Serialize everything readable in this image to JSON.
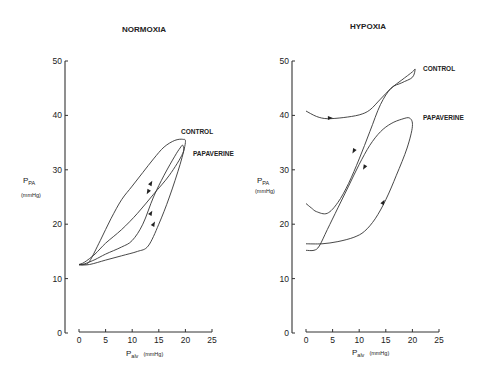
{
  "chart_data": [
    {
      "type": "line",
      "title": "NORMOXIA",
      "xlabel": "P_alv (mmHg)",
      "xlabel_main": "P",
      "xlabel_sub": "alv",
      "xlabel_unit": "(mmHg)",
      "ylabel_main": "P",
      "ylabel_sub": "PA",
      "ylabel_unit": "(mmHg)",
      "xlim": [
        0,
        25
      ],
      "ylim": [
        0,
        50
      ],
      "xticks": [
        0,
        5,
        10,
        15,
        20,
        25
      ],
      "yticks": [
        0,
        10,
        20,
        30,
        40,
        50
      ],
      "grid": false,
      "series": [
        {
          "name": "CONTROL",
          "points": [
            [
              0,
              12.6
            ],
            [
              1,
              12.6
            ],
            [
              2,
              13.2
            ],
            [
              4,
              17
            ],
            [
              6,
              21
            ],
            [
              8,
              24.5
            ],
            [
              10,
              27
            ],
            [
              12,
              29.5
            ],
            [
              14,
              32
            ],
            [
              16,
              34.2
            ],
            [
              18,
              35.4
            ],
            [
              19.5,
              35.6
            ],
            [
              20,
              35
            ],
            [
              19,
              31
            ],
            [
              17,
              25
            ],
            [
              15,
              20
            ],
            [
              13,
              16
            ],
            [
              11,
              15
            ],
            [
              8,
              14.2
            ],
            [
              5,
              13.4
            ],
            [
              2,
              12.6
            ],
            [
              0,
              12.5
            ]
          ],
          "arrows": [
            [
              13.5,
              27.5,
              "up"
            ],
            [
              13.5,
              22,
              "up"
            ]
          ]
        },
        {
          "name": "PAPAVERINE",
          "points": [
            [
              0,
              12.6
            ],
            [
              1,
              12.7
            ],
            [
              3,
              13.5
            ],
            [
              5,
              14.5
            ],
            [
              8,
              15.8
            ],
            [
              10,
              17
            ],
            [
              12,
              20
            ],
            [
              14,
              25
            ],
            [
              16,
              29
            ],
            [
              18,
              32.5
            ],
            [
              19,
              34
            ],
            [
              19.5,
              34.5
            ],
            [
              19.5,
              33
            ],
            [
              17,
              29
            ],
            [
              14,
              25.5
            ],
            [
              11,
              22
            ],
            [
              8,
              19
            ],
            [
              5,
              16.5
            ],
            [
              3,
              14.5
            ],
            [
              1,
              13
            ],
            [
              0,
              12.6
            ]
          ],
          "arrows": [
            [
              13,
              26,
              "down"
            ],
            [
              14,
              20,
              "up"
            ]
          ]
        }
      ],
      "annotations": [
        "CONTROL",
        "PAPAVERINE"
      ]
    },
    {
      "type": "line",
      "title": "HYPOXIA",
      "xlabel": "P_alv (mmHg)",
      "xlabel_main": "P",
      "xlabel_sub": "alv",
      "xlabel_unit": "(mmHg)",
      "ylabel_main": "P",
      "ylabel_sub": "PA",
      "ylabel_unit": "(mmHg)",
      "xlim": [
        0,
        25
      ],
      "ylim": [
        0,
        50
      ],
      "xticks": [
        0,
        5,
        10,
        15,
        20,
        25
      ],
      "yticks": [
        0,
        10,
        20,
        30,
        40,
        50
      ],
      "grid": false,
      "series": [
        {
          "name": "CONTROL",
          "points": [
            [
              0,
              40.8
            ],
            [
              2,
              39.8
            ],
            [
              4,
              39.4
            ],
            [
              7,
              39.6
            ],
            [
              10,
              40.1
            ],
            [
              12,
              41
            ],
            [
              14,
              43
            ],
            [
              16,
              45
            ],
            [
              18,
              46.5
            ],
            [
              20,
              48
            ],
            [
              20.5,
              48.5
            ],
            [
              20,
              47
            ],
            [
              18,
              46
            ],
            [
              16,
              45
            ],
            [
              14,
              42
            ],
            [
              12,
              37
            ],
            [
              10,
              32
            ],
            [
              8,
              27.5
            ],
            [
              6,
              24
            ],
            [
              4,
              22
            ],
            [
              2,
              22.3
            ],
            [
              1,
              23
            ],
            [
              0,
              23.8
            ]
          ],
          "arrows": [
            [
              4.5,
              39.5,
              "right"
            ],
            [
              9,
              33.5,
              "down"
            ]
          ]
        },
        {
          "name": "PAPAVERINE",
          "points": [
            [
              0,
              15.2
            ],
            [
              1.5,
              15.2
            ],
            [
              2.5,
              16
            ],
            [
              4,
              19
            ],
            [
              6,
              23
            ],
            [
              8,
              27
            ],
            [
              10,
              31
            ],
            [
              12,
              34.5
            ],
            [
              14,
              37
            ],
            [
              16,
              38.5
            ],
            [
              18,
              39.3
            ],
            [
              19.5,
              39.5
            ],
            [
              20,
              38
            ],
            [
              19,
              34
            ],
            [
              17,
              29
            ],
            [
              15,
              24.5
            ],
            [
              13,
              21
            ],
            [
              11,
              18.7
            ],
            [
              9,
              17.6
            ],
            [
              6,
              16.8
            ],
            [
              3,
              16.4
            ],
            [
              0,
              16.4
            ]
          ],
          "arrows": [
            [
              11,
              30.5,
              "down"
            ],
            [
              14.5,
              24,
              "up"
            ]
          ]
        }
      ],
      "annotations": [
        "CONTROL",
        "PAPAVERINE"
      ]
    }
  ]
}
